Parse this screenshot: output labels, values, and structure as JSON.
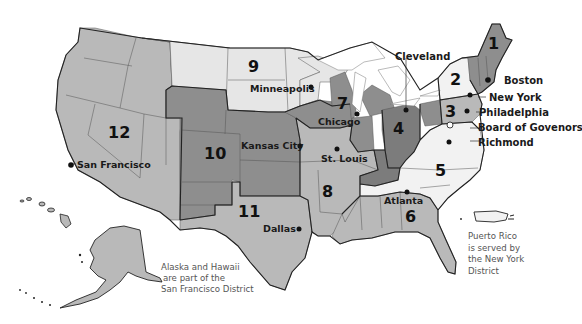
{
  "colors": {
    "light": "#e6e6e6",
    "lighter": "#f2f2f2",
    "mid": "#b9b9b9",
    "dark": "#8e8e8e",
    "darker": "#7c7c7c",
    "water": "#ffffff",
    "ink": "#1a1a1a"
  },
  "districts": [
    {
      "number": "1",
      "city": "Boston"
    },
    {
      "number": "2",
      "city": "New York"
    },
    {
      "number": "3",
      "city": "Philadelphia"
    },
    {
      "number": "4",
      "city": "Cleveland"
    },
    {
      "number": "5",
      "city": "Richmond"
    },
    {
      "number": "6",
      "city": "Atlanta"
    },
    {
      "number": "7",
      "city": "Chicago"
    },
    {
      "number": "8",
      "city": "St. Louis"
    },
    {
      "number": "9",
      "city": "Minneapolis"
    },
    {
      "number": "10",
      "city": "Kansas City"
    },
    {
      "number": "11",
      "city": "Dallas"
    },
    {
      "number": "12",
      "city": "San Francisco"
    }
  ],
  "labels": {
    "board": "Board of Govenors"
  },
  "notes": {
    "alaska_hawaii": [
      "Alaska  and Hawaii",
      "are part of the",
      "San Francisco District"
    ],
    "puerto_rico": [
      "Puerto Rico",
      "is served by",
      "the New York",
      "District"
    ]
  }
}
